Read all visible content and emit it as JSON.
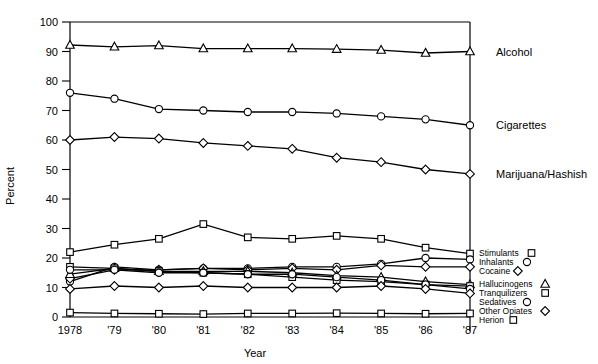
{
  "chart_data": {
    "type": "line",
    "title": "",
    "xlabel": "Year",
    "ylabel": "Percent",
    "ylim": [
      0,
      100
    ],
    "ytick_labels": [
      "0",
      "10",
      "20",
      "30",
      "40",
      "50",
      "60",
      "70",
      "80",
      "90",
      "100"
    ],
    "yticks": [
      0,
      10,
      20,
      30,
      40,
      50,
      60,
      70,
      80,
      90,
      100
    ],
    "grid": false,
    "legend_position": "right-inline",
    "x": [
      1978,
      1979,
      1980,
      1981,
      1982,
      1983,
      1984,
      1985,
      1986,
      1987
    ],
    "categories": [
      "1978",
      "'79",
      "'80",
      "'81",
      "'82",
      "'83",
      "'84",
      "'85",
      "'86",
      "'87"
    ],
    "series": [
      {
        "name": "Alcohol",
        "marker": "triangle",
        "label": "Alcohol",
        "label_side": "right",
        "values": [
          92.2,
          91.6,
          92.0,
          91.0,
          91.0,
          91.0,
          90.8,
          90.5,
          89.5,
          90.0
        ]
      },
      {
        "name": "Cigarettes",
        "marker": "circle",
        "label": "Cigarettes",
        "label_side": "right",
        "values": [
          76.0,
          74.0,
          70.5,
          70.0,
          69.5,
          69.5,
          69.0,
          68.0,
          67.0,
          65.0
        ]
      },
      {
        "name": "Marijuana/Hashish",
        "marker": "diamond",
        "label": "Marijuana/Hashish",
        "label_side": "right",
        "values": [
          60.0,
          61.0,
          60.5,
          59.0,
          58.0,
          57.0,
          54.0,
          52.5,
          50.0,
          48.5
        ]
      },
      {
        "name": "Stimulants",
        "marker": "square",
        "label": "Stimulants",
        "label_side": "legend",
        "values": [
          22.0,
          24.5,
          26.5,
          31.5,
          27.0,
          26.5,
          27.5,
          26.5,
          23.5,
          21.5
        ]
      },
      {
        "name": "Inhalants",
        "marker": "circle",
        "label": "Inhalants",
        "label_side": "legend",
        "values": [
          12.0,
          17.0,
          16.0,
          16.5,
          16.5,
          17.0,
          17.0,
          18.0,
          20.0,
          19.5
        ]
      },
      {
        "name": "Cocaine",
        "marker": "diamond",
        "label": "Cocaine",
        "label_side": "legend",
        "values": [
          13.0,
          16.0,
          16.0,
          16.5,
          16.0,
          16.5,
          16.0,
          17.5,
          17.0,
          17.0
        ]
      },
      {
        "name": "Hallucinogens",
        "marker": "triangle",
        "label": "Hallucinogens",
        "label_side": "legend",
        "values": [
          14.5,
          16.5,
          15.5,
          15.5,
          15.5,
          15.0,
          14.0,
          13.5,
          12.0,
          11.0
        ]
      },
      {
        "name": "Tranquilizers",
        "marker": "square",
        "label": "Tranquilizers",
        "label_side": "legend",
        "values": [
          17.0,
          16.5,
          15.5,
          15.0,
          14.5,
          13.5,
          12.5,
          12.0,
          11.0,
          10.5
        ]
      },
      {
        "name": "Sedatives",
        "marker": "circle",
        "label": "Sedatives",
        "label_side": "legend",
        "values": [
          16.0,
          16.0,
          15.0,
          15.0,
          14.5,
          14.5,
          13.5,
          12.5,
          11.0,
          9.5
        ]
      },
      {
        "name": "Other Opiates",
        "marker": "diamond",
        "label": "Other Opiates",
        "label_side": "legend",
        "values": [
          9.5,
          10.5,
          10.0,
          10.5,
          10.0,
          10.0,
          10.0,
          10.5,
          9.5,
          8.0
        ]
      },
      {
        "name": "Herion",
        "marker": "square",
        "label": "Herion",
        "label_side": "legend",
        "values": [
          1.5,
          1.2,
          1.1,
          1.0,
          1.2,
          1.2,
          1.3,
          1.2,
          1.1,
          1.2
        ]
      }
    ]
  },
  "colors": {
    "ink": "#000000",
    "background": "#ffffff",
    "marker_fill": "#ffffff"
  }
}
